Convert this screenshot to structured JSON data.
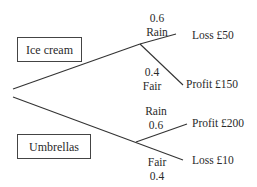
{
  "decision_tree": {
    "options": [
      {
        "label": "Ice cream",
        "outcomes": [
          {
            "condition": "Rain",
            "probability": "0.6",
            "result": "Loss £50"
          },
          {
            "condition": "Fair",
            "probability": "0.4",
            "result": "Profit £150"
          }
        ]
      },
      {
        "label": "Umbrellas",
        "outcomes": [
          {
            "condition": "Rain",
            "probability": "0.6",
            "result": "Profit £200"
          },
          {
            "condition": "Fair",
            "probability": "0.4",
            "result": "Loss £10"
          }
        ]
      }
    ],
    "line_color": "#333333"
  }
}
